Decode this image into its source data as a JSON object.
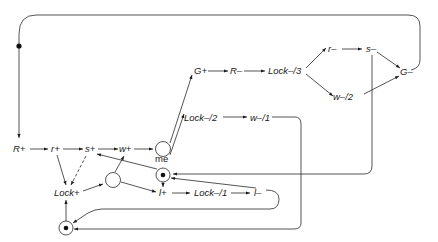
{
  "diagram": {
    "type": "petri-net / signal transition graph",
    "nodes": {
      "R_plus": "R+",
      "r_plus": "r+",
      "s_plus": "s+",
      "w_plus": "w+",
      "G_plus": "G+",
      "R_minus": "R–",
      "Lock_minus_3": "Lock–/3",
      "r_minus": "r–",
      "s_minus": "s–",
      "G_minus": "G–",
      "w_minus_2": "w–/2",
      "Lock_minus_2": "Lock–/2",
      "w_minus_1": "w–/1",
      "Lock_plus": "Lock+",
      "l_plus": "l+",
      "Lock_minus_1": "Lock–/1",
      "l_minus": "l–"
    },
    "places": {
      "me_label": "me",
      "marked": [
        "me",
        "bottom-place",
        "top-loop-token"
      ],
      "unmarked": [
        "choice-place",
        "merge-place"
      ]
    },
    "edges": [
      [
        "top-loop-token",
        "R+"
      ],
      [
        "R+",
        "r+"
      ],
      [
        "r+",
        "s+"
      ],
      [
        "s+",
        "w+"
      ],
      [
        "w+",
        "choice-place"
      ],
      [
        "choice-place",
        "G+"
      ],
      [
        "choice-place",
        "Lock–/2"
      ],
      [
        "G+",
        "R–"
      ],
      [
        "R–",
        "Lock–/3"
      ],
      [
        "Lock–/3",
        "r–"
      ],
      [
        "Lock–/3",
        "w–/2"
      ],
      [
        "r–",
        "s–"
      ],
      [
        "s–",
        "G–"
      ],
      [
        "w–/2",
        "G–"
      ],
      [
        "G–",
        "top-loop-token"
      ],
      [
        "s–",
        "me"
      ],
      [
        "Lock–/2",
        "w–/1"
      ],
      [
        "w–/1",
        "bottom-place"
      ],
      [
        "r+",
        "Lock+"
      ],
      [
        "s+",
        "Lock+",
        "dashed"
      ],
      [
        "me",
        "s+"
      ],
      [
        "me",
        "l+"
      ],
      [
        "Lock+",
        "merge-place"
      ],
      [
        "merge-place",
        "w+"
      ],
      [
        "merge-place",
        "l+"
      ],
      [
        "l+",
        "Lock–/1"
      ],
      [
        "Lock–/1",
        "l–"
      ],
      [
        "l–",
        "me"
      ],
      [
        "l–",
        "bottom-place"
      ],
      [
        "bottom-place",
        "Lock+"
      ]
    ]
  }
}
